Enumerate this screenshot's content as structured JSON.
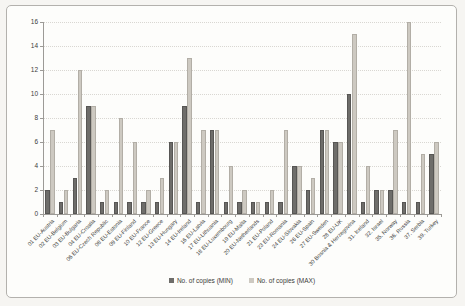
{
  "chart_data": {
    "type": "bar",
    "title": "",
    "xlabel": "",
    "ylabel": "",
    "ylim": [
      0,
      16
    ],
    "yticks": [
      0,
      2,
      4,
      6,
      8,
      10,
      12,
      14,
      16
    ],
    "grid": true,
    "legend_position": "bottom",
    "categories": [
      "01 EU-Austria",
      "02 EU-Belgium",
      "03 EU-Bulgaria",
      "04 EU-Croatia",
      "06 EU-Czech Republic",
      "08 EU-Estonia",
      "09 EU-Finland",
      "10 EU-France",
      "12 EU-Greece",
      "13 EU-Hungary",
      "14 EU-Ireland",
      "16 EU-Latvia",
      "17 EU-Lithuania",
      "18 EU-Luxembourg",
      "19 EU-Malta",
      "20 EU-Netherlands",
      "21 EU-Poland",
      "23 EU-Romania",
      "24 EU-Slovakia",
      "26 EU-Spain",
      "27 EU-Sweden",
      "28 EU-UK",
      "30 Bosnia & Herzegovina",
      "31. Iceland",
      "32. Israel",
      "35. Norway",
      "36. Russia",
      "37. Serbia",
      "39. Turkey"
    ],
    "series": [
      {
        "name": "No. of copies (MIN)",
        "color": "#6e6d6a",
        "values": [
          2,
          1,
          3,
          9,
          1,
          1,
          1,
          1,
          1,
          6,
          9,
          1,
          7,
          1,
          1,
          1,
          1,
          1,
          4,
          2,
          7,
          6,
          10,
          1,
          2,
          2,
          1,
          1,
          5
        ]
      },
      {
        "name": "No. of copies (MAX)",
        "color": "#cdc9c1",
        "values": [
          7,
          2,
          12,
          9,
          2,
          8,
          6,
          2,
          3,
          6,
          13,
          7,
          7,
          4,
          2,
          1,
          2,
          7,
          4,
          3,
          7,
          6,
          15,
          4,
          2,
          7,
          16,
          5,
          6
        ]
      }
    ]
  }
}
